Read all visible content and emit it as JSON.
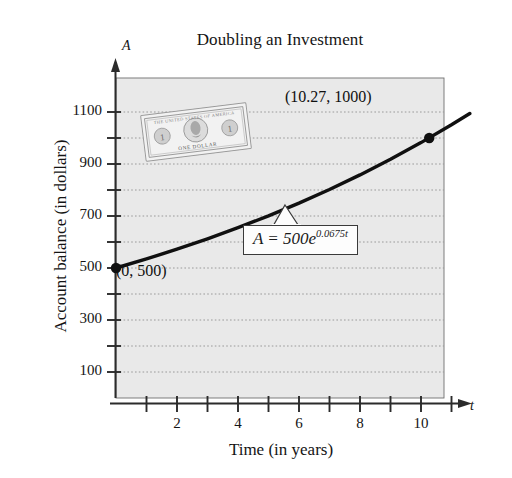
{
  "chart_data": {
    "type": "line",
    "title": "Doubling an Investment",
    "xlabel": "Time (in years)",
    "ylabel": "Account balance (in dollars)",
    "x_axis_symbol": "t",
    "y_axis_symbol": "A",
    "xlim": [
      0,
      11.6
    ],
    "ylim": [
      0,
      1180
    ],
    "grid": true,
    "grid_orientation": "horizontal",
    "grid_style": "dotted",
    "legend": null,
    "equation_text": "A = 500e",
    "equation_exponent": "0.0675t",
    "equation_full": "A = 500e^(0.0675t)",
    "formula_params": {
      "principal": 500,
      "rate": 0.0675
    },
    "xticks_major": [
      2,
      4,
      6,
      8,
      10
    ],
    "xticks_all": [
      1,
      2,
      3,
      4,
      5,
      6,
      7,
      8,
      9,
      10,
      11
    ],
    "xtick_labels": [
      "2",
      "4",
      "6",
      "8",
      "10"
    ],
    "yticks_labeled": [
      100,
      300,
      500,
      700,
      900,
      1100
    ],
    "ytick_labels": [
      "100",
      "300",
      "500",
      "700",
      "900",
      "1100"
    ],
    "yticks_minor": [
      200,
      400,
      600,
      800,
      1000
    ],
    "gridlines": [
      100,
      200,
      300,
      400,
      500,
      600,
      700,
      800,
      900,
      1000,
      1100
    ],
    "series": [
      {
        "name": "A = 500e^(0.0675t)",
        "x": [
          0,
          1,
          2,
          3,
          4,
          5,
          6,
          7,
          8,
          9,
          10,
          11,
          11.6
        ],
        "values": [
          500,
          534.9,
          572.2,
          612.2,
          655.0,
          700.7,
          749.7,
          802.1,
          858.1,
          918.1,
          982.3,
          1050.9,
          1094.2
        ]
      }
    ],
    "annotated_points": [
      {
        "label": "(0, 500)",
        "x": 0,
        "y": 500
      },
      {
        "label": "(10.27, 1000)",
        "x": 10.27,
        "y": 1000
      }
    ],
    "decoration": {
      "name": "dollar-bill-image",
      "denomination": "ONE DOLLAR"
    }
  },
  "colors": {
    "plot_background": "#e9e9e9",
    "curve": "#101010",
    "axis": "#2b2b2b",
    "gridline": "#9a9a9a",
    "text": "#141414",
    "callout_fill": "#fdfdfd",
    "callout_border": "#3a3a3a"
  }
}
